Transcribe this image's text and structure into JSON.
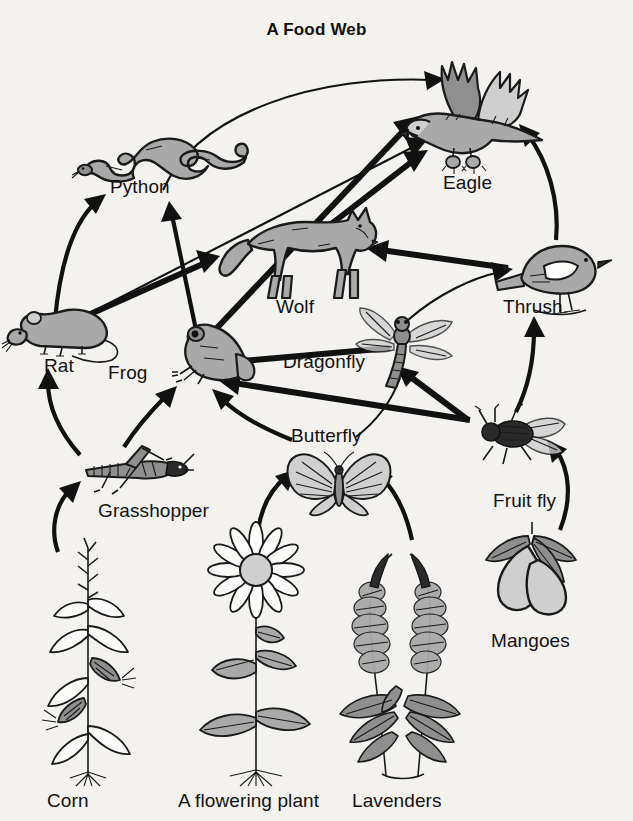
{
  "title": "A Food Web",
  "diagram": {
    "type": "food-web",
    "organisms": [
      {
        "id": "python",
        "label": "Python",
        "icon": "snake-icon",
        "x": 76,
        "y": 130,
        "label_x": 110,
        "label_y": 185
      },
      {
        "id": "eagle",
        "label": "Eagle",
        "icon": "eagle-icon",
        "x": 400,
        "y": 62,
        "label_x": 443,
        "label_y": 180
      },
      {
        "id": "wolf",
        "label": "Wolf",
        "icon": "wolf-icon",
        "x": 222,
        "y": 205,
        "label_x": 276,
        "label_y": 305
      },
      {
        "id": "rat",
        "label": "Rat",
        "icon": "rat-icon",
        "x": 8,
        "y": 300,
        "label_x": 44,
        "label_y": 364
      },
      {
        "id": "frog",
        "label": "Frog",
        "icon": "frog-icon",
        "x": 178,
        "y": 322,
        "label_x": 110,
        "label_y": 372
      },
      {
        "id": "dragonfly",
        "label": "Dragonfly",
        "icon": "dragonfly-icon",
        "x": 358,
        "y": 305,
        "label_x": 283,
        "label_y": 360
      },
      {
        "id": "thrush",
        "label": "Thrush",
        "icon": "thrush-icon",
        "x": 498,
        "y": 236,
        "label_x": 503,
        "label_y": 305
      },
      {
        "id": "butterfly",
        "label": "Butterfly",
        "icon": "butterfly-icon",
        "x": 288,
        "y": 440,
        "label_x": 291,
        "label_y": 440
      },
      {
        "id": "fruitfly",
        "label": "Fruit fly",
        "icon": "fly-icon",
        "x": 477,
        "y": 408,
        "label_x": 493,
        "label_y": 500
      },
      {
        "id": "grasshopper",
        "label": "Grasshopper",
        "icon": "grasshopper-icon",
        "x": 84,
        "y": 448,
        "label_x": 98,
        "label_y": 510
      },
      {
        "id": "mangoes",
        "label": "Mangoes",
        "icon": "mangoes-icon",
        "x": 480,
        "y": 524,
        "label_x": 491,
        "label_y": 640
      },
      {
        "id": "corn",
        "label": "Corn",
        "icon": "corn-plant-icon",
        "x": 40,
        "y": 540,
        "label_x": 47,
        "label_y": 800
      },
      {
        "id": "flowering_plant",
        "label": "A flowering plant",
        "icon": "daisy-plant-icon",
        "x": 200,
        "y": 524,
        "label_x": 178,
        "label_y": 800
      },
      {
        "id": "lavenders",
        "label": "Lavenders",
        "icon": "lavender-plant-icon",
        "x": 340,
        "y": 548,
        "label_x": 352,
        "label_y": 800
      }
    ],
    "links": [
      {
        "from": "rat",
        "to": "python"
      },
      {
        "from": "rat",
        "to": "wolf"
      },
      {
        "from": "rat",
        "to": "eagle"
      },
      {
        "from": "frog",
        "to": "python"
      },
      {
        "from": "frog",
        "to": "eagle"
      },
      {
        "from": "python",
        "to": "eagle"
      },
      {
        "from": "wolf",
        "to": "eagle"
      },
      {
        "from": "thrush",
        "to": "eagle"
      },
      {
        "from": "thrush",
        "to": "wolf"
      },
      {
        "from": "grasshopper",
        "to": "rat"
      },
      {
        "from": "grasshopper",
        "to": "frog"
      },
      {
        "from": "corn",
        "to": "grasshopper"
      },
      {
        "from": "butterfly",
        "to": "frog"
      },
      {
        "from": "flowering_plant",
        "to": "butterfly"
      },
      {
        "from": "lavenders",
        "to": "butterfly"
      },
      {
        "from": "dragonfly",
        "to": "frog"
      },
      {
        "from": "dragonfly",
        "to": "thrush"
      },
      {
        "from": "fruitfly",
        "to": "frog"
      },
      {
        "from": "fruitfly",
        "to": "dragonfly"
      },
      {
        "from": "fruitfly",
        "to": "thrush"
      },
      {
        "from": "mangoes",
        "to": "fruitfly"
      },
      {
        "from": "butterfly",
        "to": "dragonfly"
      }
    ]
  }
}
